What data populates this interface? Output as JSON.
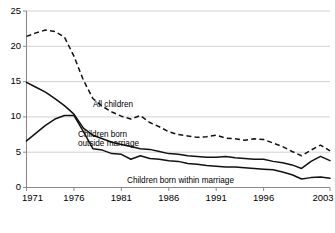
{
  "chart_data": {
    "type": "line",
    "title": "",
    "subtitle": "",
    "xlabel": "",
    "ylabel": "",
    "xlim": [
      1971,
      2003
    ],
    "ylim": [
      0,
      25
    ],
    "grid": true,
    "legend_position": "inline-annotations",
    "x_ticks": [
      "1971",
      "1976",
      "1981",
      "1986",
      "1991",
      "1996",
      "2003"
    ],
    "x_tick_values": [
      1971,
      1976,
      1981,
      1986,
      1991,
      1996,
      2003
    ],
    "y_ticks": [
      "0",
      "5",
      "10",
      "15",
      "20",
      "25"
    ],
    "y_tick_values": [
      0,
      5,
      10,
      15,
      20,
      25
    ],
    "x": [
      1971,
      1972,
      1973,
      1974,
      1975,
      1976,
      1977,
      1978,
      1979,
      1980,
      1981,
      1982,
      1983,
      1984,
      1985,
      1986,
      1987,
      1988,
      1989,
      1990,
      1991,
      1992,
      1993,
      1994,
      1995,
      1996,
      1997,
      1998,
      1999,
      2000,
      2001,
      2002,
      2003
    ],
    "series": [
      {
        "name": "All children",
        "style": "dashed",
        "color": "#111111",
        "values": [
          21.4,
          21.9,
          22.3,
          22.1,
          21.3,
          18.6,
          15.2,
          12.6,
          11.5,
          10.7,
          10.1,
          9.7,
          10.2,
          9.2,
          8.6,
          7.9,
          7.5,
          7.3,
          7.1,
          7.2,
          7.4,
          7.0,
          6.9,
          6.7,
          6.9,
          6.8,
          6.3,
          5.8,
          5.1,
          4.5,
          5.3,
          6.0,
          5.2
        ],
        "annotation": {
          "text": "All children",
          "x": 1979.3,
          "y": 12.6
        }
      },
      {
        "name": "Children born outside marriage",
        "style": "solid",
        "color": "#111111",
        "values": [
          14.9,
          14.2,
          13.5,
          12.6,
          11.6,
          10.4,
          8.4,
          7.4,
          6.9,
          6.4,
          6.1,
          5.8,
          5.5,
          5.4,
          5.1,
          4.8,
          4.7,
          4.5,
          4.4,
          4.3,
          4.3,
          4.4,
          4.2,
          4.1,
          4.0,
          4.0,
          3.7,
          3.5,
          3.2,
          2.7,
          3.7,
          4.4,
          3.8
        ],
        "annotation": {
          "text": "Children born\noutside marriage",
          "x": 1981.6,
          "y": 8.5
        }
      },
      {
        "name": "Children born within marriage",
        "style": "solid",
        "color": "#111111",
        "values": [
          6.6,
          7.7,
          8.8,
          9.7,
          10.2,
          10.2,
          7.9,
          5.5,
          5.3,
          4.8,
          4.7,
          4.0,
          4.5,
          4.1,
          4.0,
          3.8,
          3.7,
          3.4,
          3.3,
          3.1,
          3.0,
          2.9,
          2.9,
          2.8,
          2.7,
          2.6,
          2.5,
          2.2,
          1.8,
          1.2,
          1.4,
          1.5,
          1.3
        ],
        "annotation": {
          "text": "Children born within marriage",
          "x": 1989.0,
          "y": 1.9
        }
      }
    ],
    "annotations": [
      {
        "name": "all-children-label",
        "text": "All children"
      },
      {
        "name": "outside-marriage-label-line1",
        "text": "Children born"
      },
      {
        "name": "outside-marriage-label-line2",
        "text": "outside marriage"
      },
      {
        "name": "within-marriage-label",
        "text": "Children born within marriage"
      }
    ],
    "colors": {
      "line": "#111111",
      "gridline": "#bfbfbf",
      "axis": "#8a8a8a",
      "background": "#ffffff",
      "text": "#000000"
    }
  }
}
